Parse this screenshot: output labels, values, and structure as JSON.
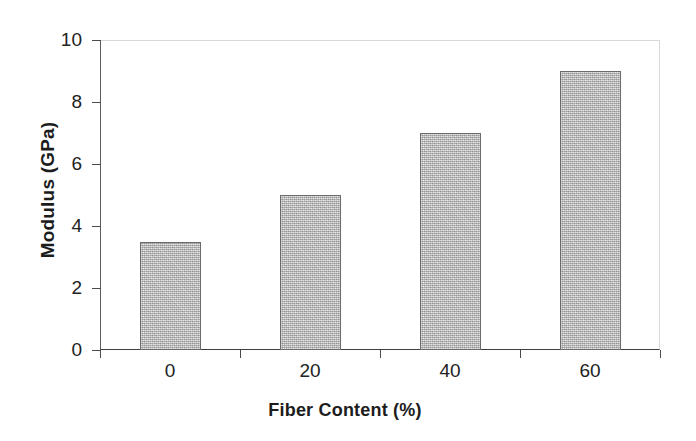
{
  "chart_data": {
    "type": "bar",
    "title": "",
    "categories": [
      "0",
      "20",
      "40",
      "60"
    ],
    "values": [
      3.5,
      5.0,
      7.0,
      9.0
    ],
    "xlabel": "Fiber Content (%)",
    "ylabel": "Modulus (GPa)",
    "ylim": [
      0,
      10
    ],
    "y_ticks": [
      "0",
      "2",
      "4",
      "6",
      "8",
      "10"
    ],
    "y_tick_values": [
      0,
      2,
      4,
      6,
      8,
      10
    ],
    "grid": false,
    "legend": false,
    "legend_position": "none",
    "colors": {
      "bar_fill": "#b6b6b6",
      "bar_edge": "#6b6b6b",
      "axis": "#3f3f3f",
      "frame_light": "#d8d8d8",
      "text": "#1c1c1c",
      "background": "#ffffff"
    }
  }
}
